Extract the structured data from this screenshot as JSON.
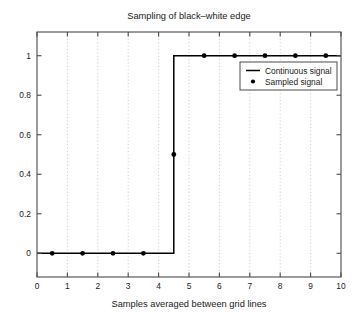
{
  "chart_data": {
    "type": "line",
    "title": "Sampling of black–white edge",
    "xlabel": "Samples averaged between grid lines",
    "ylabel": "",
    "xlim": [
      0,
      10
    ],
    "ylim": [
      -0.12,
      1.12
    ],
    "grid": "vertical-dotted-at-integers",
    "legend_position": "upper-right-inside",
    "xticks": [
      0,
      1,
      2,
      3,
      4,
      5,
      6,
      7,
      8,
      9,
      10
    ],
    "xticklabels": [
      "0",
      "1",
      "2",
      "3",
      "4",
      "5",
      "6",
      "7",
      "8",
      "9",
      "10"
    ],
    "yticks": [
      0,
      0.2,
      0.4,
      0.6,
      0.8,
      1
    ],
    "yticklabels": [
      "0",
      "0.2",
      "0.4",
      "0.6",
      "0.8",
      "1"
    ],
    "series": [
      {
        "name": "Continuous signal",
        "marker": "line",
        "type": "step",
        "x": [
          0,
          4.5,
          4.5,
          10
        ],
        "y": [
          0,
          0,
          1,
          1
        ]
      },
      {
        "name": "Sampled signal",
        "marker": "dot",
        "type": "scatter",
        "x": [
          0.5,
          1.5,
          2.5,
          3.5,
          4.5,
          5.5,
          6.5,
          7.5,
          8.5,
          9.5
        ],
        "y": [
          0,
          0,
          0,
          0,
          0.5,
          1,
          1,
          1,
          1,
          1
        ]
      }
    ],
    "annotations": []
  },
  "legend": {
    "entries": [
      {
        "label": "Continuous signal",
        "marker": "line-swatch"
      },
      {
        "label": "Sampled signal",
        "marker": "dot-swatch"
      }
    ]
  },
  "colors": {
    "background": "#ffffff",
    "line": "#000000",
    "marker": "#000000",
    "axis": "#4a4a4a",
    "grid": "#b8b8b8",
    "text": "#1a1a1a"
  }
}
